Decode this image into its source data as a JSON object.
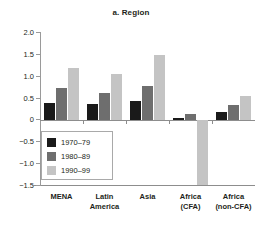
{
  "chart_data": {
    "type": "bar",
    "title": "a. Region",
    "xlabel": "",
    "ylabel": "",
    "ylim": [
      -1.5,
      2.0
    ],
    "yticks": [
      2.0,
      1.5,
      1.0,
      0.5,
      0,
      -0.5,
      -1.0,
      -1.5
    ],
    "ytick_labels": [
      "2.0",
      "1.5",
      "1.0",
      "0.5",
      "0",
      "−0.5",
      "−1.0",
      "−1.5"
    ],
    "grid": false,
    "legend_position": "inside-lower-left",
    "categories": [
      "MENA",
      "Latin America",
      "Asia",
      "Africa (CFA)",
      "Africa (non-CFA)"
    ],
    "category_lines": [
      [
        "MENA",
        ""
      ],
      [
        "Latin",
        "America"
      ],
      [
        "Asia",
        ""
      ],
      [
        "Africa",
        "(CFA)"
      ],
      [
        "Africa",
        "(non-CFA)"
      ]
    ],
    "series": [
      {
        "name": "1970–79",
        "color": "#1a1a1a",
        "values": [
          0.38,
          0.35,
          0.43,
          0.03,
          0.16
        ]
      },
      {
        "name": "1980–89",
        "color": "#6e6e6e",
        "values": [
          0.73,
          0.61,
          0.77,
          0.13,
          0.34
        ]
      },
      {
        "name": "1990–99",
        "color": "#c4c4c4",
        "values": [
          1.17,
          1.04,
          1.47,
          -1.5,
          0.54
        ]
      }
    ]
  },
  "legend": {
    "items": [
      {
        "label": "1970–79",
        "color": "#1a1a1a"
      },
      {
        "label": "1980–89",
        "color": "#6e6e6e"
      },
      {
        "label": "1990–99",
        "color": "#c4c4c4"
      }
    ]
  },
  "axis": {
    "y_labels": [
      "2.0",
      "1.5",
      "1.0",
      "0.5",
      "0",
      "−0.5",
      "−1.0",
      "−1.5"
    ]
  }
}
